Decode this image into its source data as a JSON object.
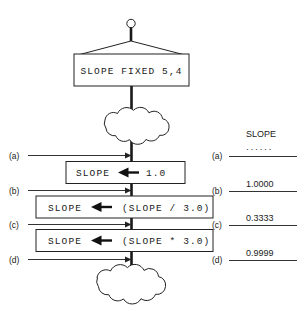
{
  "diagram": {
    "title_box": {
      "label": "SLOPE  FIXED  5,4",
      "icon": "hanging-sign"
    },
    "clouds": [
      {
        "name": "cloud-top",
        "label": ""
      },
      {
        "name": "cloud-bottom",
        "label": ""
      }
    ],
    "statements": [
      {
        "id": "stmt-1",
        "target": "SLOPE",
        "arrow": "assign-left-arrow",
        "expression": "1.0"
      },
      {
        "id": "stmt-2",
        "target": "SLOPE",
        "arrow": "assign-left-arrow",
        "expression": "(SLOPE / 3.0)"
      },
      {
        "id": "stmt-3",
        "target": "SLOPE",
        "arrow": "assign-left-arrow",
        "expression": "(SLOPE * 3.0)"
      }
    ],
    "probe_points": [
      {
        "key": "(a)"
      },
      {
        "key": "(b)"
      },
      {
        "key": "(c)"
      },
      {
        "key": "(d)"
      }
    ],
    "value_table": {
      "header": "SLOPE",
      "rows": [
        {
          "key": "(a)",
          "value": "······"
        },
        {
          "key": "(b)",
          "value": "1.0000"
        },
        {
          "key": "(c)",
          "value": "0.3333"
        },
        {
          "key": "(d)",
          "value": "0.9999"
        }
      ]
    },
    "colors": {
      "background": "#ffffff",
      "ink": "#1a1a1a",
      "line": "#222222"
    }
  }
}
